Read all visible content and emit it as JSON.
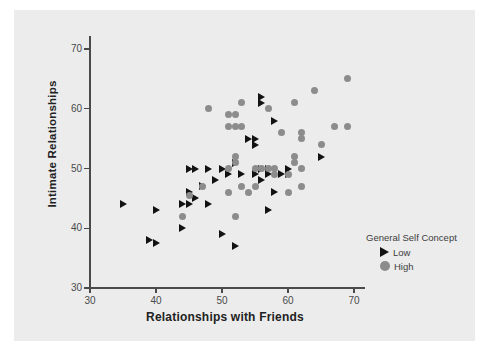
{
  "chart_data": {
    "type": "scatter",
    "title": "",
    "xlabel": "Relationships with Friends",
    "ylabel": "Intimate Relationships",
    "xlim": [
      26,
      73
    ],
    "ylim": [
      28,
      72
    ],
    "xticks": [
      30,
      40,
      50,
      60,
      70
    ],
    "yticks": [
      30,
      40,
      50,
      60,
      70
    ],
    "grid": false,
    "legend": {
      "title": "General Self Concept",
      "position": "right",
      "entries": [
        {
          "label": "Low",
          "marker": "triangle-right",
          "color": "#121212"
        },
        {
          "label": "High",
          "marker": "circle",
          "color": "#8c8c8c"
        }
      ]
    },
    "series": [
      {
        "name": "Low",
        "marker": "triangle-right",
        "color": "#121212",
        "points": [
          [
            35,
            44
          ],
          [
            40,
            43
          ],
          [
            39,
            38
          ],
          [
            40,
            37.5
          ],
          [
            44,
            44
          ],
          [
            45,
            44
          ],
          [
            44,
            40
          ],
          [
            45,
            46
          ],
          [
            45,
            50
          ],
          [
            46,
            50
          ],
          [
            46,
            45
          ],
          [
            47,
            47
          ],
          [
            48,
            50
          ],
          [
            48,
            44
          ],
          [
            49,
            48
          ],
          [
            50,
            39
          ],
          [
            50,
            50
          ],
          [
            51,
            49
          ],
          [
            52,
            37
          ],
          [
            52,
            51
          ],
          [
            53,
            49
          ],
          [
            54,
            55
          ],
          [
            55,
            49
          ],
          [
            55,
            55
          ],
          [
            55,
            54
          ],
          [
            56,
            48
          ],
          [
            56,
            50
          ],
          [
            56,
            62
          ],
          [
            56,
            61
          ],
          [
            57,
            50
          ],
          [
            57,
            49
          ],
          [
            57,
            43
          ],
          [
            58,
            58
          ],
          [
            58,
            46
          ],
          [
            59,
            49
          ],
          [
            60,
            49
          ],
          [
            60,
            50
          ],
          [
            65,
            52
          ]
        ]
      },
      {
        "name": "High",
        "marker": "circle",
        "color": "#8c8c8c",
        "points": [
          [
            44,
            42
          ],
          [
            45,
            45.5
          ],
          [
            47,
            47
          ],
          [
            48,
            60
          ],
          [
            51,
            57
          ],
          [
            51,
            59
          ],
          [
            51,
            50
          ],
          [
            51,
            46
          ],
          [
            52,
            57
          ],
          [
            52,
            59
          ],
          [
            52,
            51
          ],
          [
            52,
            52
          ],
          [
            52,
            42
          ],
          [
            53,
            61
          ],
          [
            53,
            57
          ],
          [
            53,
            47
          ],
          [
            54,
            46
          ],
          [
            55,
            50
          ],
          [
            55,
            47
          ],
          [
            56,
            50
          ],
          [
            57,
            50
          ],
          [
            57,
            60
          ],
          [
            58,
            50
          ],
          [
            58,
            49
          ],
          [
            59,
            56
          ],
          [
            60,
            49
          ],
          [
            60,
            46
          ],
          [
            61,
            61
          ],
          [
            61,
            52
          ],
          [
            61,
            51
          ],
          [
            62,
            56
          ],
          [
            62,
            55
          ],
          [
            62,
            50
          ],
          [
            62,
            47
          ],
          [
            64,
            63
          ],
          [
            65,
            54
          ],
          [
            67,
            57
          ],
          [
            69,
            57
          ],
          [
            69,
            65
          ]
        ]
      }
    ]
  },
  "axes": {
    "x": {
      "label": "Relationships with Friends",
      "ticks": [
        "30",
        "40",
        "50",
        "60",
        "70"
      ]
    },
    "y": {
      "label": "Intimate Relationships",
      "ticks": [
        "30",
        "40",
        "50",
        "60",
        "70"
      ]
    }
  },
  "legend": {
    "title": "General Self Concept",
    "low_label": "Low",
    "high_label": "High"
  },
  "colors": {
    "panel_background": "#ececec",
    "page_background": "#ffffff",
    "axis": "#4a4a4a",
    "low_marker": "#121212",
    "high_marker": "#8c8c8c",
    "text": "#222222"
  }
}
